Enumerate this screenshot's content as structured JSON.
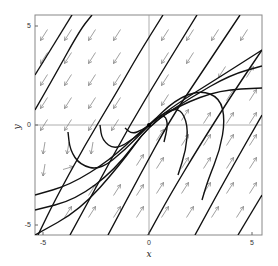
{
  "chart_data": {
    "type": "line",
    "subtype": "phase-portrait",
    "title": "",
    "xlabel": "x",
    "ylabel": "y",
    "xlim": [
      -5.4,
      5.4
    ],
    "ylim": [
      -5.5,
      5.5
    ],
    "xticks": [
      -5,
      0,
      5
    ],
    "yticks": [
      -5,
      0,
      5
    ],
    "xtick_labels": [
      "-5",
      "0",
      "5"
    ],
    "ytick_labels": [
      "-5",
      "0",
      "5"
    ],
    "grid": false,
    "axes_through_origin": true,
    "equilibrium": [
      0,
      0
    ],
    "frame_px": {
      "left": 35,
      "right": 262,
      "top": 15,
      "bottom": 235
    },
    "origin_px": [
      149,
      125
    ],
    "trajectories_px": [
      [
        [
          35,
          75
        ],
        [
          72,
          15
        ]
      ],
      [
        [
          38,
          235
        ],
        [
          55,
          200
        ],
        [
          85,
          145
        ],
        [
          118,
          90
        ],
        [
          138,
          55
        ],
        [
          163,
          15
        ]
      ],
      [
        [
          70,
          235
        ],
        [
          100,
          180
        ],
        [
          130,
          125
        ],
        [
          160,
          75
        ],
        [
          197,
          15
        ]
      ],
      [
        [
          108,
          235
        ],
        [
          140,
          175
        ],
        [
          170,
          120
        ],
        [
          200,
          75
        ],
        [
          240,
          15
        ]
      ],
      [
        [
          148,
          235
        ],
        [
          170,
          195
        ],
        [
          200,
          145
        ],
        [
          235,
          90
        ],
        [
          262,
          50
        ]
      ],
      [
        [
          195,
          235
        ],
        [
          225,
          180
        ],
        [
          262,
          115
        ]
      ],
      [
        [
          238,
          235
        ],
        [
          262,
          195
        ]
      ],
      [
        [
          35,
          110
        ],
        [
          55,
          75
        ],
        [
          80,
          30
        ],
        [
          92,
          15
        ]
      ],
      [
        [
          35,
          195
        ],
        [
          70,
          185
        ],
        [
          110,
          160
        ],
        [
          140,
          132
        ],
        [
          149,
          125
        ],
        [
          175,
          105
        ],
        [
          215,
          80
        ],
        [
          262,
          50
        ]
      ],
      [
        [
          35,
          210
        ],
        [
          75,
          200
        ],
        [
          115,
          170
        ],
        [
          149,
          125
        ],
        [
          190,
          98
        ],
        [
          230,
          75
        ],
        [
          262,
          66
        ]
      ],
      [
        [
          35,
          235
        ],
        [
          80,
          210
        ],
        [
          120,
          165
        ],
        [
          149,
          125
        ],
        [
          180,
          105
        ],
        [
          220,
          90
        ],
        [
          262,
          88
        ]
      ],
      [
        [
          68,
          132
        ],
        [
          70,
          150
        ],
        [
          80,
          165
        ],
        [
          100,
          170
        ],
        [
          125,
          150
        ],
        [
          149,
          125
        ],
        [
          175,
          100
        ],
        [
          200,
          90
        ],
        [
          220,
          98
        ],
        [
          225,
          120
        ],
        [
          220,
          150
        ],
        [
          208,
          180
        ],
        [
          202,
          200
        ]
      ],
      [
        [
          100,
          125
        ],
        [
          102,
          140
        ],
        [
          115,
          150
        ],
        [
          135,
          138
        ],
        [
          149,
          125
        ],
        [
          165,
          112
        ],
        [
          180,
          108
        ],
        [
          188,
          125
        ],
        [
          186,
          150
        ],
        [
          178,
          175
        ]
      ],
      [
        [
          125,
          128
        ],
        [
          132,
          134
        ],
        [
          142,
          130
        ],
        [
          149,
          125
        ],
        [
          156,
          118
        ],
        [
          165,
          115
        ],
        [
          168,
          125
        ],
        [
          164,
          142
        ]
      ]
    ],
    "arrows_px": [
      {
        "x": 44,
        "y": 35,
        "dir": "dl"
      },
      {
        "x": 68,
        "y": 35,
        "dir": "dl"
      },
      {
        "x": 92,
        "y": 35,
        "dir": "dl"
      },
      {
        "x": 117,
        "y": 35,
        "dir": "dl"
      },
      {
        "x": 165,
        "y": 35,
        "dir": "dl"
      },
      {
        "x": 190,
        "y": 35,
        "dir": "dl"
      },
      {
        "x": 215,
        "y": 35,
        "dir": "dl"
      },
      {
        "x": 244,
        "y": 35,
        "dir": "dl"
      },
      {
        "x": 44,
        "y": 58,
        "dir": "dl"
      },
      {
        "x": 68,
        "y": 58,
        "dir": "dl"
      },
      {
        "x": 92,
        "y": 58,
        "dir": "dl"
      },
      {
        "x": 117,
        "y": 58,
        "dir": "dl"
      },
      {
        "x": 165,
        "y": 58,
        "dir": "dl"
      },
      {
        "x": 190,
        "y": 58,
        "dir": "dl"
      },
      {
        "x": 222,
        "y": 72,
        "dir": "dl"
      },
      {
        "x": 44,
        "y": 80,
        "dir": "dl"
      },
      {
        "x": 68,
        "y": 80,
        "dir": "dl"
      },
      {
        "x": 92,
        "y": 80,
        "dir": "dl"
      },
      {
        "x": 117,
        "y": 80,
        "dir": "dl"
      },
      {
        "x": 165,
        "y": 80,
        "dir": "dl"
      },
      {
        "x": 44,
        "y": 103,
        "dir": "dl"
      },
      {
        "x": 68,
        "y": 103,
        "dir": "dl"
      },
      {
        "x": 92,
        "y": 103,
        "dir": "dl"
      },
      {
        "x": 117,
        "y": 103,
        "dir": "dl"
      },
      {
        "x": 165,
        "y": 100,
        "dir": "dl"
      },
      {
        "x": 250,
        "y": 72,
        "dir": "ur"
      },
      {
        "x": 44,
        "y": 125,
        "dir": "dl"
      },
      {
        "x": 68,
        "y": 125,
        "dir": "dl"
      },
      {
        "x": 92,
        "y": 125,
        "dir": "dl"
      },
      {
        "x": 115,
        "y": 125,
        "dir": "dl"
      },
      {
        "x": 230,
        "y": 95,
        "dir": "ur"
      },
      {
        "x": 253,
        "y": 95,
        "dir": "ur"
      },
      {
        "x": 44,
        "y": 148,
        "dir": "d"
      },
      {
        "x": 68,
        "y": 148,
        "dir": "d"
      },
      {
        "x": 92,
        "y": 148,
        "dir": "d"
      },
      {
        "x": 185,
        "y": 115,
        "dir": "ur"
      },
      {
        "x": 207,
        "y": 118,
        "dir": "ur"
      },
      {
        "x": 230,
        "y": 118,
        "dir": "ur"
      },
      {
        "x": 253,
        "y": 118,
        "dir": "ur"
      },
      {
        "x": 44,
        "y": 170,
        "dir": "d"
      },
      {
        "x": 68,
        "y": 168,
        "dir": "r"
      },
      {
        "x": 160,
        "y": 135,
        "dir": "ur"
      },
      {
        "x": 185,
        "y": 140,
        "dir": "ur"
      },
      {
        "x": 207,
        "y": 140,
        "dir": "ur"
      },
      {
        "x": 230,
        "y": 140,
        "dir": "ur"
      },
      {
        "x": 253,
        "y": 140,
        "dir": "ur"
      },
      {
        "x": 92,
        "y": 190,
        "dir": "ur"
      },
      {
        "x": 117,
        "y": 190,
        "dir": "ur"
      },
      {
        "x": 140,
        "y": 160,
        "dir": "ur"
      },
      {
        "x": 160,
        "y": 163,
        "dir": "ur"
      },
      {
        "x": 185,
        "y": 163,
        "dir": "ur"
      },
      {
        "x": 207,
        "y": 163,
        "dir": "ur"
      },
      {
        "x": 230,
        "y": 163,
        "dir": "ur"
      },
      {
        "x": 253,
        "y": 163,
        "dir": "ur"
      },
      {
        "x": 68,
        "y": 212,
        "dir": "ur"
      },
      {
        "x": 92,
        "y": 212,
        "dir": "ur"
      },
      {
        "x": 117,
        "y": 212,
        "dir": "ur"
      },
      {
        "x": 140,
        "y": 190,
        "dir": "ur"
      },
      {
        "x": 160,
        "y": 188,
        "dir": "ur"
      },
      {
        "x": 185,
        "y": 188,
        "dir": "ur"
      },
      {
        "x": 207,
        "y": 188,
        "dir": "ur"
      },
      {
        "x": 230,
        "y": 188,
        "dir": "ur"
      },
      {
        "x": 253,
        "y": 188,
        "dir": "ur"
      },
      {
        "x": 140,
        "y": 212,
        "dir": "ur"
      },
      {
        "x": 165,
        "y": 212,
        "dir": "ur"
      },
      {
        "x": 190,
        "y": 212,
        "dir": "ur"
      },
      {
        "x": 215,
        "y": 212,
        "dir": "ur"
      },
      {
        "x": 240,
        "y": 212,
        "dir": "ur"
      }
    ]
  }
}
